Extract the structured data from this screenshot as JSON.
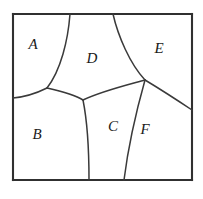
{
  "figure": {
    "kind": "partitioned-square-diagram",
    "background_color": "#ffffff",
    "frame_color": "#303030",
    "arc_color": "#3a3a3a",
    "label_color": "#1a1a1a",
    "frame": {
      "left": 13,
      "top": 14,
      "right": 192,
      "bottom": 180
    }
  },
  "regions": [
    {
      "id": "A",
      "label": "A",
      "label_x": 33,
      "label_y": 46,
      "position": "top-left"
    },
    {
      "id": "B",
      "label": "B",
      "label_x": 37,
      "label_y": 136,
      "position": "bottom-left"
    },
    {
      "id": "C",
      "label": "C",
      "label_x": 113,
      "label_y": 128,
      "position": "bottom-center"
    },
    {
      "id": "D",
      "label": "D",
      "label_x": 92,
      "label_y": 60,
      "position": "top-center"
    },
    {
      "id": "E",
      "label": "E",
      "label_x": 159,
      "label_y": 50,
      "position": "top-right"
    },
    {
      "id": "F",
      "label": "F",
      "label_x": 145,
      "label_y": 131,
      "position": "bottom-right"
    }
  ],
  "vertices": {
    "top_left": {
      "x": 13,
      "y": 14
    },
    "top_right": {
      "x": 192,
      "y": 14
    },
    "bottom_left": {
      "x": 13,
      "y": 180
    },
    "bottom_right": {
      "x": 192,
      "y": 180
    },
    "top_edge_AD": {
      "x": 70,
      "y": 14
    },
    "top_edge_DE": {
      "x": 113,
      "y": 14
    },
    "left_edge_AB": {
      "x": 13,
      "y": 98
    },
    "right_edge_EF": {
      "x": 192,
      "y": 110
    },
    "bottom_edge_BC": {
      "x": 89,
      "y": 180
    },
    "bottom_edge_CF": {
      "x": 124,
      "y": 180
    },
    "junction_ABD": {
      "x": 47,
      "y": 88
    },
    "junction_BCD": {
      "x": 83,
      "y": 100
    },
    "junction_DEF": {
      "x": 145,
      "y": 80
    }
  },
  "arcs": [
    {
      "name": "arc-A-D",
      "from": "top_edge_AD",
      "to": "junction_ABD"
    },
    {
      "name": "arc-D-E",
      "from": "top_edge_DE",
      "to": "junction_DEF"
    },
    {
      "name": "arc-A-B",
      "from": "left_edge_AB",
      "to": "junction_ABD"
    },
    {
      "name": "arc-B-D",
      "from": "junction_ABD",
      "to": "junction_BCD"
    },
    {
      "name": "arc-D-C",
      "from": "junction_BCD",
      "to": "junction_DEF"
    },
    {
      "name": "arc-B-C",
      "from": "junction_BCD",
      "to": "bottom_edge_BC"
    },
    {
      "name": "arc-C-F",
      "from": "junction_DEF",
      "to": "bottom_edge_CF"
    },
    {
      "name": "arc-E-F",
      "from": "junction_DEF",
      "to": "right_edge_EF"
    }
  ]
}
